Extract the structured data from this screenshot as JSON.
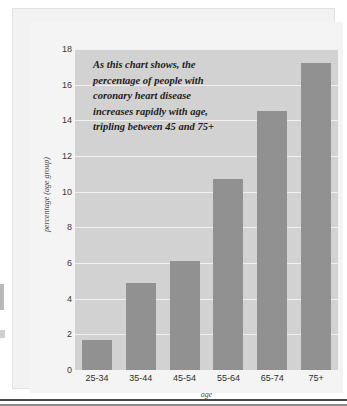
{
  "chart_data": {
    "type": "bar",
    "title": "",
    "categories": [
      "25-34",
      "35-44",
      "45-54",
      "55-64",
      "65-74",
      "75+"
    ],
    "values": [
      1.7,
      4.9,
      6.1,
      10.7,
      14.5,
      17.2
    ],
    "series": [
      {
        "name": "percentage (age group)",
        "values": [
          1.7,
          4.9,
          6.1,
          10.7,
          14.5,
          17.2
        ]
      }
    ],
    "xlabel": "age",
    "ylabel": "percentage (age group)",
    "ylim": [
      0,
      18
    ],
    "yticks": [
      "0",
      "2",
      "4",
      "6",
      "8",
      "10",
      "12",
      "14",
      "16",
      "18"
    ],
    "ytick_values": [
      0,
      2,
      4,
      6,
      8,
      10,
      12,
      14,
      16,
      18
    ],
    "grid": true,
    "legend": "none",
    "annotation_lines": [
      "As this chart shows, the",
      "percentage of people with",
      "coronary heart disease",
      "increases rapidly with age,",
      "tripling between 45 and 75+"
    ],
    "colors": {
      "bar": "#919191",
      "plot_background": "#d2d2d2",
      "gridline": "#f0f0f0",
      "card_background": "#f4f4f4",
      "text": "#2f2f2f"
    }
  }
}
